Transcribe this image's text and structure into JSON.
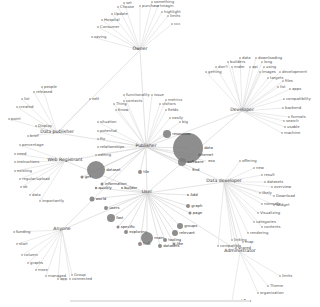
{
  "diagram": {
    "type": "network",
    "hubs": [
      {
        "id": "owner",
        "label": "Owner",
        "x": 140,
        "y": 50
      },
      {
        "id": "developer",
        "label": "Developer",
        "x": 242,
        "y": 111
      },
      {
        "id": "data_publisher",
        "label": "Data publisher",
        "x": 57,
        "y": 133
      },
      {
        "id": "web_registrant",
        "label": "Web Registrant",
        "x": 65,
        "y": 161
      },
      {
        "id": "publisher",
        "label": "Publisher",
        "x": 146,
        "y": 147
      },
      {
        "id": "data_developer",
        "label": "Data developer",
        "x": 224,
        "y": 182
      },
      {
        "id": "anyone",
        "label": "Anyone",
        "x": 62,
        "y": 230
      },
      {
        "id": "user",
        "label": "User",
        "x": 147,
        "y": 193
      },
      {
        "id": "administrator",
        "label": "Administrator",
        "x": 240,
        "y": 252
      }
    ],
    "leaves": [
      {
        "hub": "owner",
        "label": "set",
        "x": 124,
        "y": 3
      },
      {
        "hub": "owner",
        "label": "something",
        "x": 152,
        "y": 2
      },
      {
        "hub": "owner",
        "label": "Choose",
        "x": 118,
        "y": 7
      },
      {
        "hub": "owner",
        "label": "purchase",
        "x": 140,
        "y": 6
      },
      {
        "hub": "owner",
        "label": "tmagin",
        "x": 158,
        "y": 6
      },
      {
        "hub": "owner",
        "label": "Update",
        "x": 112,
        "y": 14
      },
      {
        "hub": "owner",
        "label": "highlight",
        "x": 162,
        "y": 12
      },
      {
        "hub": "owner",
        "label": "Hospital",
        "x": 102,
        "y": 20
      },
      {
        "hub": "owner",
        "label": "limits",
        "x": 168,
        "y": 16
      },
      {
        "hub": "owner",
        "label": "Consumer",
        "x": 98,
        "y": 27
      },
      {
        "hub": "owner",
        "label": "ccc",
        "x": 172,
        "y": 24
      },
      {
        "hub": "owner",
        "label": "saving",
        "x": 92,
        "y": 37
      },
      {
        "hub": "developer",
        "label": "data",
        "x": 240,
        "y": 58
      },
      {
        "hub": "developer",
        "label": "downloading",
        "x": 256,
        "y": 58
      },
      {
        "hub": "developer",
        "label": "builders",
        "x": 228,
        "y": 62
      },
      {
        "hub": "developer",
        "label": "long",
        "x": 262,
        "y": 62
      },
      {
        "hub": "developer",
        "label": "don't",
        "x": 216,
        "y": 67
      },
      {
        "hub": "developer",
        "label": "make",
        "x": 232,
        "y": 67
      },
      {
        "hub": "developer",
        "label": "api",
        "x": 250,
        "y": 67
      },
      {
        "hub": "developer",
        "label": "using",
        "x": 264,
        "y": 67
      },
      {
        "hub": "developer",
        "label": "getting",
        "x": 206,
        "y": 72
      },
      {
        "hub": "developer",
        "label": "images",
        "x": 260,
        "y": 72
      },
      {
        "hub": "developer",
        "label": "development",
        "x": 280,
        "y": 72
      },
      {
        "hub": "developer",
        "label": "targets",
        "x": 268,
        "y": 78
      },
      {
        "hub": "developer",
        "label": "files",
        "x": 283,
        "y": 81
      },
      {
        "hub": "developer",
        "label": "list",
        "x": 278,
        "y": 87
      },
      {
        "hub": "developer",
        "label": "apps",
        "x": 290,
        "y": 89
      },
      {
        "hub": "developer",
        "label": "compatibility",
        "x": 284,
        "y": 99
      },
      {
        "hub": "developer",
        "label": "backend",
        "x": 283,
        "y": 108
      },
      {
        "hub": "developer",
        "label": "formats",
        "x": 289,
        "y": 117
      },
      {
        "hub": "developer",
        "label": "search",
        "x": 284,
        "y": 121
      },
      {
        "hub": "developer",
        "label": "usable",
        "x": 285,
        "y": 127
      },
      {
        "hub": "developer",
        "label": "machine",
        "x": 282,
        "y": 133
      },
      {
        "hub": "data_publisher",
        "label": "people",
        "x": 42,
        "y": 87
      },
      {
        "hub": "data_publisher",
        "label": "released",
        "x": 34,
        "y": 92
      },
      {
        "hub": "data_publisher",
        "label": "list",
        "x": 22,
        "y": 99
      },
      {
        "hub": "data_publisher",
        "label": "created",
        "x": 17,
        "y": 107
      },
      {
        "hub": "data_publisher",
        "label": "point",
        "x": 9,
        "y": 119
      },
      {
        "hub": "data_publisher",
        "label": "Display",
        "x": 36,
        "y": 126
      },
      {
        "hub": "data_publisher",
        "label": "edit",
        "x": 90,
        "y": 99
      },
      {
        "hub": "data_publisher",
        "label": "brief",
        "x": 28,
        "y": 136
      },
      {
        "hub": "web_registrant",
        "label": "percentage",
        "x": 20,
        "y": 145
      },
      {
        "hub": "web_registrant",
        "label": "need",
        "x": 15,
        "y": 154
      },
      {
        "hub": "web_registrant",
        "label": "instructions",
        "x": 15,
        "y": 162
      },
      {
        "hub": "web_registrant",
        "label": "existing",
        "x": 15,
        "y": 171
      },
      {
        "hub": "web_registrant",
        "label": "regular/upload",
        "x": 20,
        "y": 179
      },
      {
        "hub": "web_registrant",
        "label": "ok",
        "x": 21,
        "y": 187
      },
      {
        "hub": "web_registrant",
        "label": "data",
        "x": 30,
        "y": 195
      },
      {
        "hub": "web_registrant",
        "label": "importantly",
        "x": 40,
        "y": 201
      },
      {
        "hub": "publisher",
        "label": "functionality",
        "x": 124,
        "y": 95
      },
      {
        "hub": "publisher",
        "label": "issue",
        "x": 152,
        "y": 95
      },
      {
        "hub": "publisher",
        "label": "contacts",
        "x": 124,
        "y": 101
      },
      {
        "hub": "publisher",
        "label": "metrics",
        "x": 166,
        "y": 100
      },
      {
        "hub": "publisher",
        "label": "Thing",
        "x": 114,
        "y": 104
      },
      {
        "hub": "publisher",
        "label": "visitors",
        "x": 160,
        "y": 104
      },
      {
        "hub": "publisher",
        "label": "Know",
        "x": 116,
        "y": 110
      },
      {
        "hub": "publisher",
        "label": "fields",
        "x": 166,
        "y": 110
      },
      {
        "hub": "publisher",
        "label": "situation",
        "x": 98,
        "y": 122
      },
      {
        "hub": "publisher",
        "label": "easily",
        "x": 170,
        "y": 118
      },
      {
        "hub": "publisher",
        "label": "potential",
        "x": 98,
        "y": 131
      },
      {
        "hub": "publisher",
        "label": "big",
        "x": 180,
        "y": 122
      },
      {
        "hub": "publisher",
        "label": "Fix",
        "x": 98,
        "y": 139
      },
      {
        "hub": "publisher",
        "label": "relationships",
        "x": 98,
        "y": 147
      },
      {
        "hub": "publisher",
        "label": "editing",
        "x": 96,
        "y": 155
      }
    ],
    "bubbles": [
      {
        "label": "data",
        "x": 188,
        "y": 148,
        "r": 15
      },
      {
        "label": "dataset",
        "x": 96,
        "y": 170,
        "r": 9
      },
      {
        "label": "resources",
        "x": 167,
        "y": 134,
        "r": 4
      },
      {
        "label": "software",
        "x": 182,
        "y": 162,
        "r": 4
      },
      {
        "label": "internet",
        "x": 196,
        "y": 155,
        "r": 0
      },
      {
        "label": "eco",
        "x": 206,
        "y": 161,
        "r": 0
      },
      {
        "label": "End",
        "x": 190,
        "y": 170,
        "r": 0
      },
      {
        "label": "tile",
        "x": 140,
        "y": 172,
        "r": 2
      },
      {
        "label": "get",
        "x": 82,
        "y": 177,
        "r": 1.5
      },
      {
        "label": "information",
        "x": 102,
        "y": 184,
        "r": 1.5
      },
      {
        "label": "quickly",
        "x": 96,
        "y": 188,
        "r": 1.2
      },
      {
        "label": "builder",
        "x": 122,
        "y": 188,
        "r": 1
      },
      {
        "label": "world",
        "x": 92,
        "y": 199,
        "r": 2.5
      },
      {
        "label": "users",
        "x": 106,
        "y": 208,
        "r": 2
      },
      {
        "label": "fast",
        "x": 111,
        "y": 218,
        "r": 4
      },
      {
        "label": "specific",
        "x": 118,
        "y": 227,
        "r": 1.5
      },
      {
        "label": "exploring",
        "x": 126,
        "y": 232,
        "r": 2
      },
      {
        "label": "main",
        "x": 147,
        "y": 238,
        "r": 6
      },
      {
        "label": "tooling",
        "x": 165,
        "y": 240,
        "r": 2
      },
      {
        "label": "Add",
        "x": 188,
        "y": 195,
        "r": 1
      },
      {
        "label": "graph",
        "x": 188,
        "y": 206,
        "r": 2
      },
      {
        "label": "page",
        "x": 190,
        "y": 213,
        "r": 1.5
      },
      {
        "label": "groups",
        "x": 180,
        "y": 226,
        "r": 3
      },
      {
        "label": "relevant",
        "x": 175,
        "y": 233,
        "r": 3
      },
      {
        "label": "like",
        "x": 174,
        "y": 244,
        "r": 1.5
      },
      {
        "label": "datasets",
        "x": 160,
        "y": 246,
        "r": 2
      },
      {
        "label": "hub",
        "x": 140,
        "y": 244,
        "r": 2
      }
    ],
    "data_developer_leaves": [
      {
        "label": "offering",
        "x": 240,
        "y": 161
      },
      {
        "label": "new",
        "x": 254,
        "y": 168
      },
      {
        "label": "result",
        "x": 262,
        "y": 175
      },
      {
        "label": "datasets",
        "x": 265,
        "y": 182
      },
      {
        "label": "overview",
        "x": 272,
        "y": 187
      },
      {
        "label": "likely",
        "x": 260,
        "y": 193
      },
      {
        "label": "Download",
        "x": 274,
        "y": 196
      },
      {
        "label": "normally",
        "x": 262,
        "y": 204
      },
      {
        "label": "Widget",
        "x": 274,
        "y": 205
      },
      {
        "label": "Visualizing",
        "x": 258,
        "y": 213
      },
      {
        "label": "categories",
        "x": 254,
        "y": 222
      },
      {
        "label": "contents",
        "x": 262,
        "y": 227
      },
      {
        "label": "rendering",
        "x": 248,
        "y": 233
      },
      {
        "label": "linking",
        "x": 232,
        "y": 240
      },
      {
        "label": "map",
        "x": 243,
        "y": 242
      },
      {
        "label": "compatible",
        "x": 218,
        "y": 246
      },
      {
        "label": "shared",
        "x": 236,
        "y": 248
      }
    ],
    "anyone_leaves": [
      {
        "label": "funding",
        "x": 14,
        "y": 232
      },
      {
        "label": "start",
        "x": 17,
        "y": 244
      },
      {
        "label": "column",
        "x": 22,
        "y": 255
      },
      {
        "label": "graphs",
        "x": 28,
        "y": 263
      },
      {
        "label": "more",
        "x": 36,
        "y": 270
      },
      {
        "label": "managed",
        "x": 46,
        "y": 276
      },
      {
        "label": "Group",
        "x": 72,
        "y": 275
      },
      {
        "label": "app",
        "x": 58,
        "y": 279
      },
      {
        "label": "connected",
        "x": 70,
        "y": 279
      }
    ],
    "administrator_leaves": [
      {
        "label": "limits",
        "x": 280,
        "y": 276
      },
      {
        "label": "Theme",
        "x": 268,
        "y": 286
      },
      {
        "label": "organization",
        "x": 258,
        "y": 293
      },
      {
        "label": "workflow",
        "x": 232,
        "y": 301
      }
    ],
    "hub_links": [
      [
        "owner",
        "publisher"
      ],
      [
        "owner",
        "data_publisher"
      ],
      [
        "data_publisher",
        "publisher"
      ],
      [
        "web_registrant",
        "publisher"
      ],
      [
        "web_registrant",
        "user"
      ],
      [
        "anyone",
        "publisher"
      ],
      [
        "anyone",
        "user"
      ],
      [
        "developer",
        "publisher"
      ],
      [
        "developer",
        "user"
      ],
      [
        "publisher",
        "user"
      ],
      [
        "data_developer",
        "user"
      ],
      [
        "data_developer",
        "publisher"
      ],
      [
        "administrator",
        "data_developer"
      ],
      [
        "administrator",
        "user"
      ]
    ]
  },
  "colors": {
    "background": "#ffffff",
    "edge": "#dcdcdc",
    "bubble": "#7a7a7a",
    "text": "#333333"
  }
}
